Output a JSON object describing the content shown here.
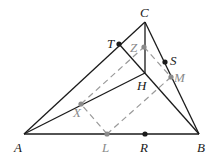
{
  "colors": {
    "primary": "#1a1a1a",
    "secondary": "#8a8a8a"
  },
  "points": {
    "A": {
      "label": "A",
      "style": "primary"
    },
    "B": {
      "label": "B",
      "style": "primary"
    },
    "C": {
      "label": "C",
      "style": "primary"
    },
    "H": {
      "label": "H",
      "style": "primary"
    },
    "T": {
      "label": "T",
      "style": "primary"
    },
    "S": {
      "label": "S",
      "style": "primary"
    },
    "R": {
      "label": "R",
      "style": "primary"
    },
    "Z": {
      "label": "Z",
      "style": "secondary"
    },
    "M": {
      "label": "M",
      "style": "secondary"
    },
    "X": {
      "label": "X",
      "style": "secondary"
    },
    "L": {
      "label": "L",
      "style": "secondary"
    }
  },
  "segments": {
    "solid": [
      [
        "A",
        "B"
      ],
      [
        "B",
        "C"
      ],
      [
        "C",
        "A"
      ],
      [
        "A",
        "H"
      ],
      [
        "C",
        "H"
      ],
      [
        "T",
        "B"
      ]
    ],
    "dashed": [
      [
        "X",
        "Z"
      ],
      [
        "Z",
        "M"
      ],
      [
        "M",
        "L"
      ],
      [
        "L",
        "X"
      ]
    ]
  }
}
